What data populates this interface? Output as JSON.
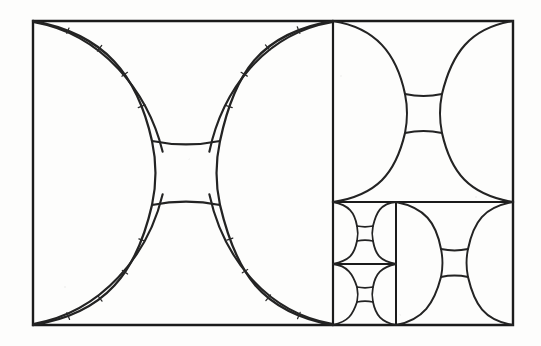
{
  "figure": {
    "medium": "pen-on-paper line drawing",
    "background_color": "#fdfdfc",
    "ink_color": "#1b1b1b",
    "arc_color": "#232323",
    "canvas": {
      "width": 541,
      "height": 346
    }
  },
  "frame": {
    "name": "outer-rectangle",
    "x": 33,
    "y": 21,
    "width": 480,
    "height": 304,
    "stroke_width": 2.4
  },
  "dividers": [
    {
      "id": "vertical-main",
      "orientation": "vertical",
      "x": 333,
      "y1": 21,
      "y2": 325,
      "stroke_width": 2.2
    },
    {
      "id": "horizontal-right",
      "orientation": "horizontal",
      "y": 202,
      "x1": 333,
      "x2": 513,
      "stroke_width": 2.2
    },
    {
      "id": "vertical-right-lower",
      "orientation": "vertical",
      "x": 396,
      "y1": 202,
      "y2": 325,
      "stroke_width": 2.0
    },
    {
      "id": "horizontal-small",
      "orientation": "horizontal",
      "y": 264,
      "x1": 333,
      "x2": 396,
      "stroke_width": 1.8
    }
  ],
  "cells": [
    {
      "id": "cell-1",
      "label": "large-left-cell",
      "level": 1,
      "x": 33,
      "y": 21,
      "width": 300,
      "height": 304,
      "style": "doubled-band",
      "band_offset": 13,
      "center_square": {
        "x": 152,
        "y": 141,
        "width": 68,
        "height": 64
      },
      "arc_stroke_width": 2.3,
      "tick_marks": true,
      "tick_count": 17
    },
    {
      "id": "cell-2",
      "label": "right-upper-cell",
      "level": 2,
      "x": 333,
      "y": 21,
      "width": 180,
      "height": 181,
      "style": "single-line",
      "band_offset": 0,
      "center_square": {
        "x": 405,
        "y": 94,
        "width": 37,
        "height": 39
      },
      "arc_stroke_width": 2.1,
      "tick_marks": false,
      "tick_count": 0
    },
    {
      "id": "cell-3",
      "label": "right-lower-large-cell",
      "level": 3,
      "x": 396,
      "y": 202,
      "width": 117,
      "height": 123,
      "style": "single-line",
      "band_offset": 0,
      "center_square": {
        "x": 441,
        "y": 249,
        "width": 27,
        "height": 28
      },
      "arc_stroke_width": 2.0,
      "tick_marks": false,
      "tick_count": 0
    },
    {
      "id": "cell-4",
      "label": "small-upper-cell",
      "level": 4,
      "x": 333,
      "y": 202,
      "width": 63,
      "height": 62,
      "style": "single-line",
      "band_offset": 0,
      "center_square": {
        "x": 357,
        "y": 226,
        "width": 16,
        "height": 15
      },
      "arc_stroke_width": 1.8,
      "tick_marks": false,
      "tick_count": 0
    },
    {
      "id": "cell-5",
      "label": "small-lower-cell",
      "level": 5,
      "x": 333,
      "y": 264,
      "width": 63,
      "height": 61,
      "style": "single-line",
      "band_offset": 0,
      "center_square": {
        "x": 357,
        "y": 287,
        "width": 16,
        "height": 15
      },
      "arc_stroke_width": 1.8,
      "tick_marks": false,
      "tick_count": 0
    }
  ],
  "motif": {
    "name": "concave-square-astroid",
    "arc_count_per_cell": 4,
    "description": "Four arcs bow inward from the cell corners and terminate on the four sides of a small central square."
  }
}
